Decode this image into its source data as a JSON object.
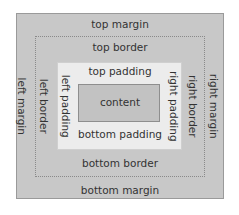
{
  "diagram": {
    "layers": {
      "margin": {
        "top": "top margin",
        "bottom": "bottom margin",
        "left": "left margin",
        "right": "right margin"
      },
      "border": {
        "top": "top border",
        "bottom": "bottom border",
        "left": "left border",
        "right": "right border"
      },
      "padding": {
        "top": "top padding",
        "bottom": "bottom padding",
        "left": "left padding",
        "right": "right padding"
      },
      "content": "content"
    },
    "colors": {
      "margin_fill": "#c8c8c8",
      "padding_fill": "#ececec",
      "content_fill": "#c2c2c2",
      "border_line": "#8a8a8a"
    }
  }
}
